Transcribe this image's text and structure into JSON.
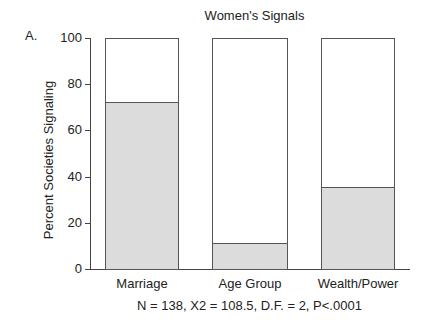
{
  "panel_label": "A.",
  "chart_data": {
    "type": "bar",
    "title": "Women's Signals",
    "xlabel": "",
    "ylabel": "Percent Societies Signaling",
    "categories": [
      "Marriage",
      "Age Group",
      "Wealth/Power"
    ],
    "values": [
      72,
      11,
      35
    ],
    "ylim": [
      0,
      100
    ],
    "yticks": [
      0,
      20,
      40,
      60,
      80,
      100
    ],
    "grid": false,
    "legend": null,
    "annotation": "N = 138, X2 = 108.5, D.F. = 2, P<.0001",
    "colors": {
      "fill": "#dcdcdc",
      "empty": "#ffffff",
      "stroke": "#555555"
    }
  },
  "yticks_labels": [
    "100",
    "80",
    "60",
    "40",
    "20",
    "0"
  ]
}
